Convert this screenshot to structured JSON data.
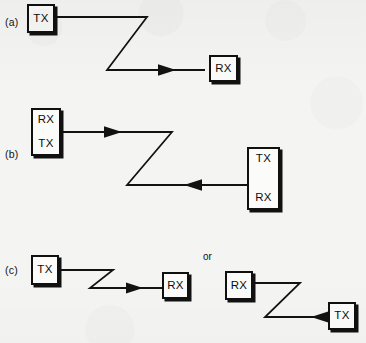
{
  "figure": {
    "background_color": "#f4f4f3",
    "ink_color": "#111111",
    "width": 366,
    "height": 343
  },
  "panels": [
    {
      "id": "a",
      "label": "(a)",
      "label_pos": {
        "x": 5,
        "y": 16
      },
      "boxes": [
        {
          "name": "tx-box",
          "labels": [
            "TX"
          ],
          "x": 27,
          "y": 4,
          "w": 28,
          "h": 29,
          "kind": "single"
        },
        {
          "name": "rx-box",
          "labels": [
            "RX"
          ],
          "x": 209,
          "y": 55,
          "w": 29,
          "h": 27,
          "kind": "single"
        }
      ],
      "path": "M55,17 L147,17 L107,70 L205,70",
      "arrow": {
        "x": 175,
        "y": 70,
        "dir": "right"
      }
    },
    {
      "id": "b",
      "label": "(b)",
      "label_pos": {
        "x": 5,
        "y": 148
      },
      "boxes": [
        {
          "name": "rx-tx-box",
          "labels": [
            "RX",
            "TX"
          ],
          "x": 31,
          "y": 108,
          "w": 30,
          "h": 48,
          "kind": "dual"
        },
        {
          "name": "tx-rx-box",
          "labels": [
            "TX",
            "RX"
          ],
          "x": 247,
          "y": 147,
          "w": 33,
          "h": 63,
          "kind": "dual"
        }
      ],
      "path": "M61,132 L172,132 L127,185 L247,185",
      "arrow_forward": {
        "x": 120,
        "y": 132,
        "dir": "right"
      },
      "arrow_return": {
        "x": 186,
        "y": 185,
        "dir": "left"
      }
    },
    {
      "id": "c",
      "label": "(c)",
      "label_pos": {
        "x": 5,
        "y": 264
      },
      "or_label": "or",
      "or_pos": {
        "x": 203,
        "y": 251
      },
      "boxes": [
        {
          "name": "tx-box-left",
          "labels": [
            "TX"
          ],
          "x": 31,
          "y": 255,
          "w": 28,
          "h": 30,
          "kind": "single"
        },
        {
          "name": "rx-box-left",
          "labels": [
            "RX"
          ],
          "x": 162,
          "y": 272,
          "w": 27,
          "h": 27,
          "kind": "single"
        },
        {
          "name": "rx-box-right",
          "labels": [
            "RX"
          ],
          "x": 225,
          "y": 271,
          "w": 28,
          "h": 29,
          "kind": "single"
        },
        {
          "name": "tx-box-right",
          "labels": [
            "TX"
          ],
          "x": 328,
          "y": 302,
          "w": 28,
          "h": 28,
          "kind": "single"
        }
      ],
      "path_left": "M59,270 L113,270 L90,288 L162,288",
      "arrow_left": {
        "x": 142,
        "y": 288,
        "dir": "right"
      },
      "path_right": "M253,283 L300,283 L265,317 L328,317",
      "arrow_right": {
        "x": 284,
        "y": 317,
        "dir": "left"
      }
    }
  ]
}
